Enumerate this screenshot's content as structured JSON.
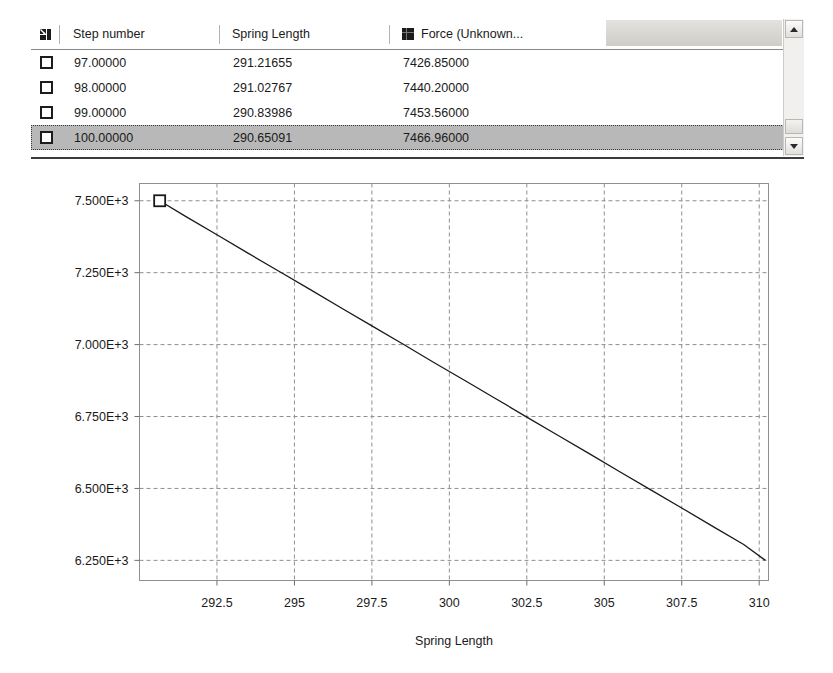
{
  "grid": {
    "corner_icon": "select-all-icon",
    "columns": [
      {
        "key": "step",
        "label": "Step number"
      },
      {
        "key": "spring",
        "label": "Spring Length"
      },
      {
        "key": "force",
        "label": "Force (Unknown...",
        "swatch_color": "#1a1a1a"
      }
    ],
    "rows": [
      {
        "checked": false,
        "selected": false,
        "step": "97.00000",
        "spring": "291.21655",
        "force": "7426.85000"
      },
      {
        "checked": false,
        "selected": false,
        "step": "98.00000",
        "spring": "291.02767",
        "force": "7440.20000"
      },
      {
        "checked": false,
        "selected": false,
        "step": "99.00000",
        "spring": "290.83986",
        "force": "7453.56000"
      },
      {
        "checked": false,
        "selected": true,
        "step": "100.00000",
        "spring": "290.65091",
        "force": "7466.96000"
      }
    ],
    "scrollbar": {
      "up_arrow": "chevron-up-icon",
      "down_arrow": "chevron-down-icon"
    }
  },
  "chart_data": {
    "type": "line",
    "title": "",
    "xlabel": "Spring Length",
    "ylabel": "",
    "xlim": [
      290.0,
      310.3
    ],
    "ylim": [
      6180,
      7560
    ],
    "grid": true,
    "legend": false,
    "xticks": [
      292.5,
      295,
      297.5,
      300,
      302.5,
      305,
      307.5,
      310
    ],
    "xtick_labels": [
      "292.5",
      "295",
      "297.5",
      "300",
      "302.5",
      "305",
      "307.5",
      "310"
    ],
    "yticks": [
      7500,
      7250,
      7000,
      6750,
      6500,
      6250
    ],
    "ytick_labels": [
      "7.500E+3",
      "7.250E+3",
      "7.000E+3",
      "6.750E+3",
      "6.500E+3",
      "6.250E+3"
    ],
    "series": [
      {
        "name": "Force (Unknown...",
        "color": "#1a1a1a",
        "marker": "square",
        "marker_at": [
          0
        ],
        "x": [
          290.65091,
          291.5,
          292.5,
          293.5,
          294.5,
          295.5,
          296.5,
          297.5,
          298.5,
          299.5,
          300.5,
          301.5,
          302.5,
          303.5,
          304.5,
          305.5,
          306.5,
          307.5,
          308.5,
          309.5,
          310.2
        ],
        "y": [
          7500,
          7445,
          7382,
          7318,
          7255,
          7192,
          7128,
          7065,
          7002,
          6938,
          6875,
          6812,
          6748,
          6685,
          6622,
          6558,
          6495,
          6432,
          6368,
          6305,
          6250
        ]
      }
    ]
  }
}
